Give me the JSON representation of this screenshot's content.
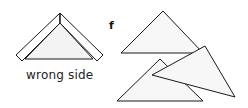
{
  "figure_left": {
    "caption": "wrong side"
  },
  "figure_right": {
    "label": "f"
  },
  "colors": {
    "stroke": "#1a1a1a",
    "fill": "#f7f7f7"
  }
}
